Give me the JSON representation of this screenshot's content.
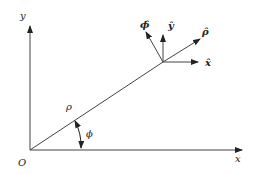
{
  "diagram": {
    "stroke_color": "#333333",
    "axes": {
      "x_label": "x",
      "y_label": "y",
      "origin_label": "O"
    },
    "radial": {
      "length_label": "ρ",
      "angle_label": "ϕ"
    },
    "unit_vectors": {
      "x_hat": "x̂",
      "y_hat": "ŷ",
      "rho_hat": "ρ̂",
      "phi_hat": "ϕ̂"
    }
  }
}
